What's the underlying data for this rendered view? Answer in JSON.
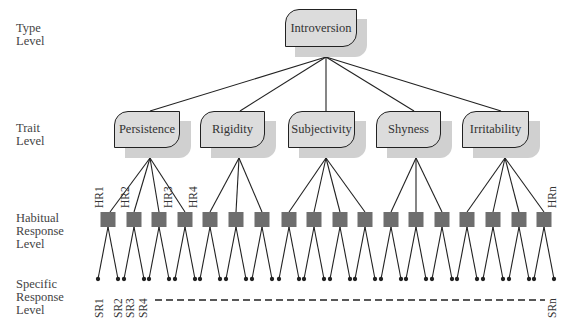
{
  "levels": {
    "type": "Type\nLevel",
    "trait": "Trait\nLevel",
    "habitual": "Habitual\nResponse\nLevel",
    "specific": "Specific\nResponse\nLevel"
  },
  "type_node": {
    "label": "Introversion"
  },
  "traits": [
    {
      "label": "Persistence",
      "habitual_count": 4
    },
    {
      "label": "Rigidity",
      "habitual_count": 3
    },
    {
      "label": "Subjectivity",
      "habitual_count": 4
    },
    {
      "label": "Shyness",
      "habitual_count": 3
    },
    {
      "label": "Irritability",
      "habitual_count": 4
    }
  ],
  "habitual_labels": [
    "HR1",
    "HR2",
    "HR3",
    "HR4",
    "HRn"
  ],
  "specific_labels": [
    "SR1",
    "SR2",
    "SR3",
    "SR4",
    "SRn"
  ],
  "colors": {
    "box_fill": "#dcdcdc",
    "shadow": "#d0d0d0",
    "square": "#6e6e6e",
    "line": "#222222"
  }
}
